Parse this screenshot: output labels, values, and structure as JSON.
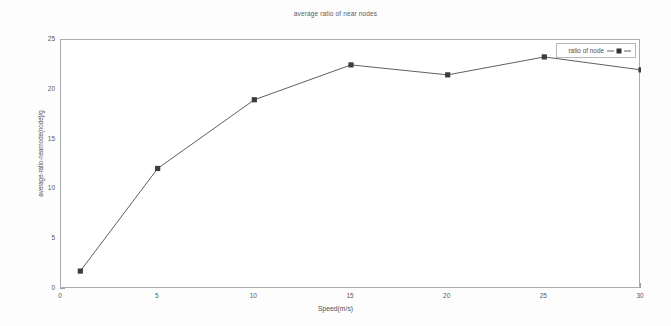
{
  "chart_data": {
    "type": "line",
    "title": "average ratio of near nodes",
    "xlabel": "Speed(m/s)",
    "ylabel": "average-ratio-nearnode(node)/g",
    "xlim": [
      0,
      30
    ],
    "ylim": [
      0,
      25
    ],
    "grid": false,
    "legend_position": "top-right-inside",
    "x": [
      1,
      5,
      10,
      15,
      20,
      25,
      30
    ],
    "xticks": [
      "0",
      "5",
      "10",
      "15",
      "20",
      "25",
      "30"
    ],
    "yticks": [
      "0",
      "5",
      "10",
      "15",
      "20",
      "25"
    ],
    "series": [
      {
        "name": "ratio of node",
        "marker": "filled-square",
        "line_style": "solid-thin",
        "color": "#3a3e42",
        "values": [
          1.8,
          12.1,
          19.0,
          22.5,
          21.5,
          23.3,
          22.0
        ]
      }
    ]
  },
  "legend": {
    "entries": [
      {
        "label": "ratio of node"
      }
    ]
  },
  "colors": {
    "line": "#4a4e52",
    "marker": "#303438",
    "axis": "#a9adb1",
    "text": "#55595d",
    "background": "#fdfdfd"
  }
}
